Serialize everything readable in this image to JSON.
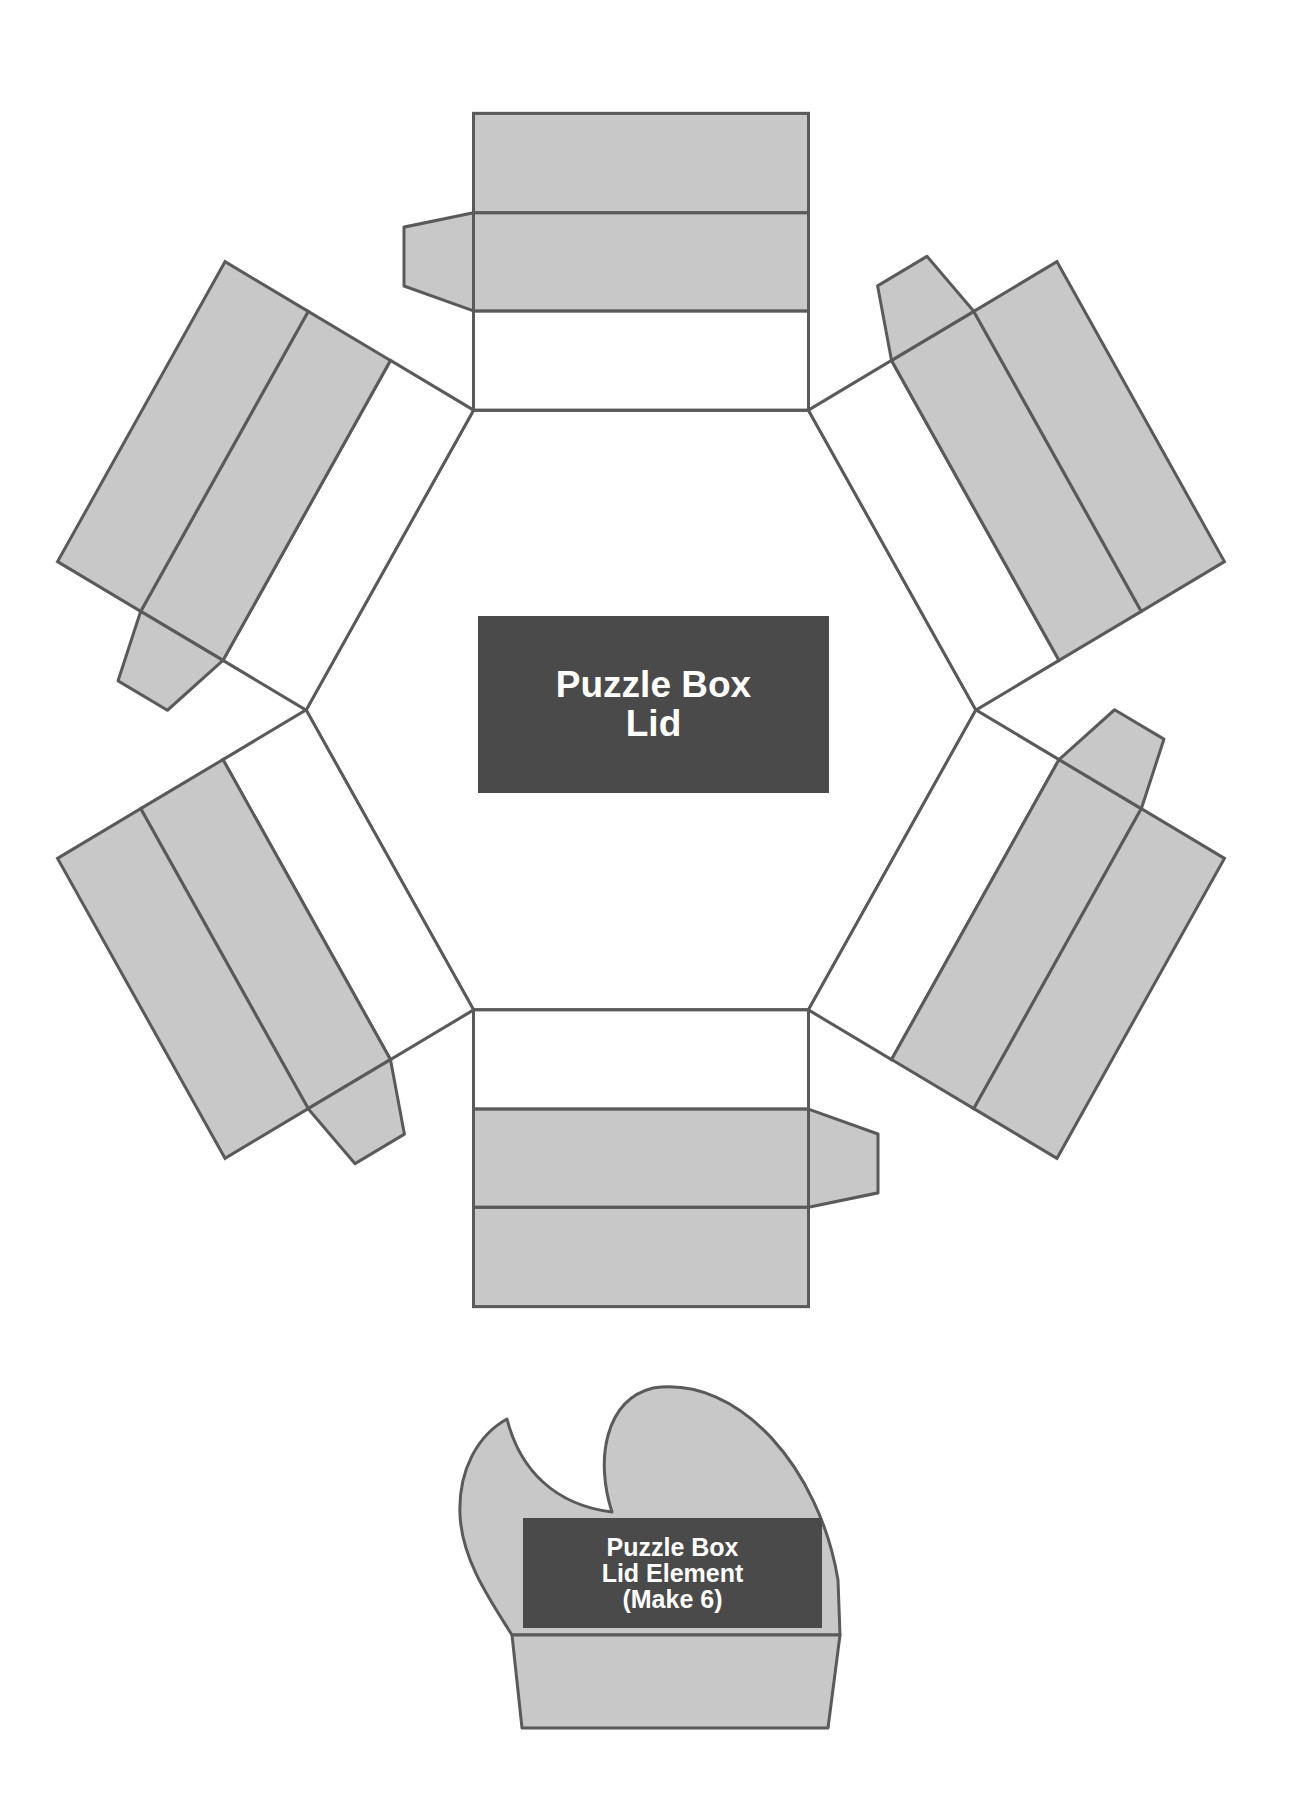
{
  "diagram": {
    "colors": {
      "panel_fill": "#c8c8c8",
      "stroke": "#5a5a5a",
      "label_fill": "#4a4a4a",
      "label_text": "#ffffff",
      "background": "#ffffff"
    },
    "lid": {
      "shape": "hexagon",
      "panels": 6,
      "label_line1": "Puzzle Box",
      "label_line2": "Lid"
    },
    "element": {
      "label_line1": "Puzzle Box",
      "label_line2": "Lid Element",
      "label_line3": "(Make 6)"
    }
  }
}
